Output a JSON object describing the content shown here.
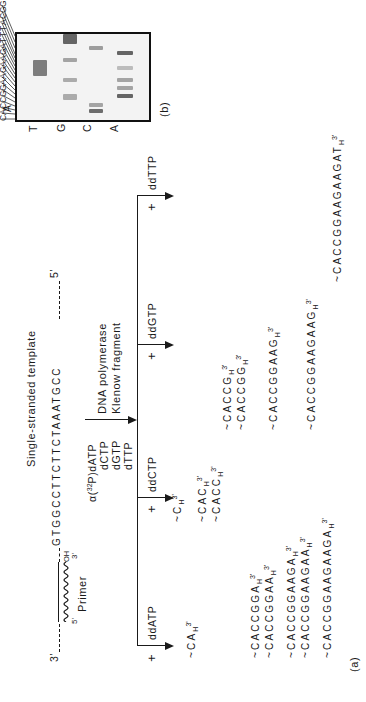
{
  "figure": {
    "part_a_label": "(a)",
    "part_b_label": "(b)",
    "colors": {
      "ink": "#1a1a1a",
      "gel_bg": "#f3f3f3",
      "band": "#555555"
    }
  },
  "template": {
    "title": "Single-stranded template",
    "end_3": "3'",
    "end_5": "5'",
    "sequence": "GTGGCCTTCTTCTAAATGCC",
    "primer_label": "Primer",
    "primer_5": "5'",
    "primer_3": "3'",
    "primer_oh": "OH"
  },
  "reaction": {
    "label_alpha": "α(",
    "isotope": "32",
    "label_p": "P)dATP",
    "dntps": [
      "dCTP",
      "dGTP",
      "dTTP"
    ],
    "enzyme_line1": "DNA  polymerase",
    "enzyme_line2": "Klenow fragment"
  },
  "branches": [
    {
      "plus": "+",
      "ddntp": "ddATP"
    },
    {
      "plus": "+",
      "ddntp": "ddCTP"
    },
    {
      "plus": "+",
      "ddntp": "ddGTP"
    },
    {
      "plus": "+",
      "ddntp": "ddTTP"
    }
  ],
  "products": {
    "ddATP": [
      {
        "prefix": "~CA",
        "tail": "H",
        "end": "3'"
      },
      {
        "prefix": "~CACCGGA",
        "tail": "H",
        "end": "3'"
      },
      {
        "prefix": "~CACCGGAA",
        "tail": "H",
        "end": "3'"
      },
      {
        "prefix": "~CACCGGAAGA",
        "tail": "H",
        "end": "3'"
      },
      {
        "prefix": "~CACCGGAAGAA",
        "tail": "H",
        "end": "3'"
      },
      {
        "prefix": "~CACCGGAAGAAGA",
        "tail": "H",
        "end": "3'"
      }
    ],
    "ddCTP": [
      {
        "prefix": "~C",
        "tail": "H",
        "end": "3'"
      },
      {
        "prefix": "~CAC",
        "tail": "H",
        "end": "3'"
      },
      {
        "prefix": "~CACC",
        "tail": "H",
        "end": "3'"
      }
    ],
    "ddGTP": [
      {
        "prefix": "~CACCG",
        "tail": "H",
        "end": "3'"
      },
      {
        "prefix": "~CACCGG",
        "tail": "H",
        "end": "3'"
      },
      {
        "prefix": "~CACCGGAAG",
        "tail": "H",
        "end": "3'"
      },
      {
        "prefix": "~CACCGGAAGAAG",
        "tail": "H",
        "end": "3'"
      }
    ],
    "ddTTP": [
      {
        "prefix": "~CACCGGAAGAAGAT",
        "tail": "H",
        "end": "3'"
      }
    ]
  },
  "gel": {
    "lanes": [
      "A",
      "C",
      "G",
      "T"
    ],
    "read_sequence": [
      "C",
      "A",
      "C",
      "C",
      "G",
      "G",
      "A",
      "A",
      "G",
      "A",
      "A",
      "G",
      "A",
      "T",
      "T",
      "T",
      "A",
      "C",
      "G",
      "G"
    ]
  }
}
